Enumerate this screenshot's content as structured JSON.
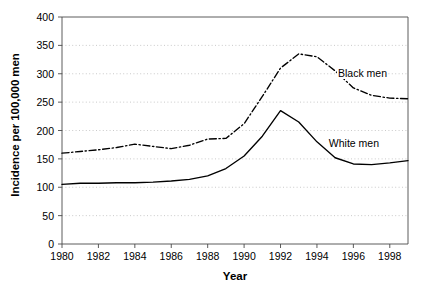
{
  "chart_data": {
    "type": "line",
    "title": "",
    "subtitle": "",
    "xlabel": "Year",
    "ylabel": "Incidence per 100,000 men",
    "xlim": [
      1980,
      1999
    ],
    "ylim": [
      0,
      400
    ],
    "ytick_labels": [
      "0",
      "50",
      "100",
      "150",
      "200",
      "250",
      "300",
      "350",
      "400"
    ],
    "ytick_values": [
      0,
      50,
      100,
      150,
      200,
      250,
      300,
      350,
      400
    ],
    "xtick_labels": [
      "1980",
      "1982",
      "1984",
      "1986",
      "1988",
      "1990",
      "1992",
      "1994",
      "1996",
      "1998"
    ],
    "xtick_values": [
      1980,
      1982,
      1984,
      1986,
      1988,
      1990,
      1992,
      1994,
      1996,
      1998
    ],
    "grid": "horizontal-dotted",
    "legend_position": "inline-annotations",
    "x": [
      1980,
      1981,
      1982,
      1983,
      1984,
      1985,
      1986,
      1987,
      1988,
      1989,
      1990,
      1991,
      1992,
      1993,
      1994,
      1995,
      1996,
      1997,
      1998,
      1999
    ],
    "series": [
      {
        "name": "Black men",
        "linestyle": "dash-dot",
        "color": "#000000",
        "label_x": 1995.1,
        "label_y": 300,
        "values": [
          160,
          163,
          166,
          170,
          176,
          172,
          168,
          174,
          185,
          186,
          212,
          260,
          310,
          335,
          330,
          305,
          275,
          262,
          257,
          256
        ]
      },
      {
        "name": "White men",
        "linestyle": "solid",
        "color": "#000000",
        "label_x": 1994.6,
        "label_y": 176,
        "values": [
          105,
          107,
          107,
          108,
          108,
          109,
          111,
          114,
          120,
          133,
          155,
          190,
          235,
          215,
          180,
          152,
          141,
          140,
          143,
          147
        ]
      }
    ]
  },
  "axis": {
    "ylabel_text": "Incidence per 100,000 men",
    "xlabel_text": "Year"
  }
}
